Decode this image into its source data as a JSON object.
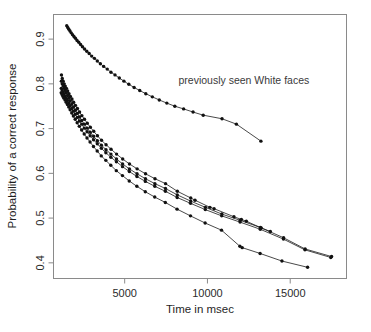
{
  "chart_data": {
    "type": "scatter",
    "title": "",
    "subtitle": "",
    "xlabel": "Time in msec",
    "ylabel": "Probability of a correct response",
    "xlim": [
      700,
      18400
    ],
    "ylim": [
      0.365,
      0.955
    ],
    "xticks": [
      5000,
      10000,
      15000
    ],
    "xticklabels": [
      "5000",
      "10000",
      "15000"
    ],
    "yticks": [
      0.4,
      0.5,
      0.6,
      0.7,
      0.8,
      0.9
    ],
    "yticklabels": [
      "0.4",
      "0.5",
      "0.6",
      "0.7",
      "0.8",
      "0.9"
    ],
    "grid": false,
    "legend": "none",
    "frame": true,
    "annotations": [
      {
        "text": "previously seen White faces",
        "x": 8250,
        "y": 0.8
      }
    ],
    "series": [
      {
        "name": "previously seen White faces",
        "marker": "filled-circle",
        "line": true,
        "x": [
          1500,
          1560,
          1625,
          1695,
          1770,
          1850,
          1935,
          2025,
          2120,
          2225,
          2335,
          2450,
          2575,
          2710,
          2855,
          3005,
          3170,
          3345,
          3530,
          3730,
          3945,
          4170,
          4415,
          4675,
          4955,
          5250,
          5570,
          5910,
          6275,
          6670,
          7090,
          7545,
          8030,
          8560,
          9130,
          9745,
          10880,
          11750,
          13230
        ],
        "y": [
          0.93,
          0.926,
          0.922,
          0.918,
          0.914,
          0.91,
          0.906,
          0.902,
          0.897,
          0.893,
          0.888,
          0.883,
          0.878,
          0.873,
          0.868,
          0.862,
          0.857,
          0.851,
          0.845,
          0.839,
          0.833,
          0.826,
          0.82,
          0.813,
          0.806,
          0.799,
          0.792,
          0.785,
          0.778,
          0.771,
          0.764,
          0.757,
          0.75,
          0.744,
          0.737,
          0.73,
          0.722,
          0.71,
          0.672
        ]
      },
      {
        "name": "curve-2",
        "marker": "filled-circle",
        "line": true,
        "x": [
          1180,
          1230,
          1285,
          1345,
          1410,
          1480,
          1555,
          1635,
          1720,
          1815,
          1915,
          2025,
          2145,
          2275,
          2415,
          2570,
          2740,
          2925,
          3130,
          3355,
          3600,
          3875,
          4175,
          4510,
          4880,
          5290,
          5750,
          6260,
          6830,
          7470,
          8180,
          8990,
          9250,
          10150,
          10400,
          11600,
          12050,
          12350,
          13250,
          13800
        ],
        "y": [
          0.82,
          0.812,
          0.806,
          0.8,
          0.795,
          0.79,
          0.784,
          0.778,
          0.772,
          0.766,
          0.759,
          0.752,
          0.745,
          0.737,
          0.729,
          0.721,
          0.712,
          0.703,
          0.694,
          0.684,
          0.674,
          0.664,
          0.654,
          0.643,
          0.632,
          0.621,
          0.61,
          0.599,
          0.588,
          0.577,
          0.56,
          0.545,
          0.54,
          0.524,
          0.521,
          0.503,
          0.497,
          0.493,
          0.478,
          0.47
        ]
      },
      {
        "name": "curve-3",
        "marker": "filled-circle",
        "line": true,
        "x": [
          1175,
          1225,
          1280,
          1340,
          1405,
          1475,
          1550,
          1630,
          1715,
          1810,
          1910,
          2020,
          2140,
          2270,
          2410,
          2565,
          2735,
          2920,
          3125,
          3350,
          3595,
          3870,
          4170,
          4505,
          4875,
          5285,
          5745,
          6255,
          6825,
          7465,
          8175,
          8985,
          9880,
          10870,
          11980,
          13200,
          14600,
          15900,
          17500
        ],
        "y": [
          0.806,
          0.8,
          0.795,
          0.79,
          0.785,
          0.78,
          0.774,
          0.768,
          0.762,
          0.755,
          0.748,
          0.741,
          0.734,
          0.726,
          0.718,
          0.71,
          0.701,
          0.692,
          0.683,
          0.673,
          0.663,
          0.653,
          0.643,
          0.632,
          0.621,
          0.61,
          0.599,
          0.588,
          0.577,
          0.566,
          0.552,
          0.538,
          0.524,
          0.509,
          0.495,
          0.479,
          0.456,
          0.431,
          0.414
        ]
      },
      {
        "name": "curve-4",
        "marker": "filled-circle",
        "line": true,
        "x": [
          1170,
          1220,
          1275,
          1335,
          1400,
          1470,
          1545,
          1625,
          1710,
          1805,
          1905,
          2015,
          2135,
          2265,
          2405,
          2560,
          2730,
          2915,
          3120,
          3345,
          3590,
          3865,
          4165,
          4500,
          4870,
          5280,
          5740,
          6250,
          6820,
          7460,
          8170,
          8980,
          9870,
          10860,
          11970,
          13190,
          14590,
          15890,
          17450
        ],
        "y": [
          0.79,
          0.786,
          0.782,
          0.778,
          0.773,
          0.768,
          0.763,
          0.757,
          0.751,
          0.745,
          0.739,
          0.732,
          0.725,
          0.717,
          0.71,
          0.701,
          0.693,
          0.684,
          0.675,
          0.666,
          0.656,
          0.646,
          0.636,
          0.626,
          0.615,
          0.604,
          0.593,
          0.582,
          0.571,
          0.56,
          0.546,
          0.533,
          0.519,
          0.505,
          0.491,
          0.475,
          0.453,
          0.429,
          0.412
        ]
      },
      {
        "name": "curve-5",
        "marker": "filled-circle",
        "line": true,
        "x": [
          1165,
          1215,
          1270,
          1330,
          1395,
          1465,
          1540,
          1620,
          1705,
          1800,
          1900,
          2010,
          2130,
          2260,
          2400,
          2555,
          2725,
          2910,
          3115,
          3340,
          3585,
          3860,
          4160,
          4495,
          4865,
          5275,
          5735,
          6245,
          6815,
          7455,
          8165,
          8975,
          9860,
          10850,
          11960,
          12100,
          13180,
          14500,
          16050
        ],
        "y": [
          0.78,
          0.776,
          0.772,
          0.768,
          0.764,
          0.759,
          0.754,
          0.748,
          0.742,
          0.735,
          0.728,
          0.721,
          0.713,
          0.705,
          0.697,
          0.688,
          0.679,
          0.67,
          0.66,
          0.65,
          0.639,
          0.629,
          0.618,
          0.606,
          0.595,
          0.583,
          0.571,
          0.559,
          0.547,
          0.535,
          0.52,
          0.505,
          0.489,
          0.473,
          0.437,
          0.434,
          0.421,
          0.404,
          0.39
        ]
      }
    ]
  },
  "plot": {
    "annotation_text": "previously seen White faces",
    "xlabel": "Time in msec",
    "ylabel": "Probability of a correct response",
    "xtick_0": "5000",
    "xtick_1": "10000",
    "xtick_2": "15000",
    "ytick_0": "0.4",
    "ytick_1": "0.5",
    "ytick_2": "0.6",
    "ytick_3": "0.7",
    "ytick_4": "0.8",
    "ytick_5": "0.9"
  },
  "colors": {
    "point": "#111111",
    "line": "#1a1a1a",
    "frame": "#8a8a8a",
    "text": "#2b2b2b",
    "background": "#ffffff"
  }
}
